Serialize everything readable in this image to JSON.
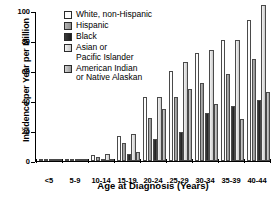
{
  "chart_data": {
    "type": "bar",
    "title": "",
    "subtitle": "",
    "xlabel": "Age at Diagnosis (Years)",
    "ylabel": "Incidence per Year per Million",
    "categories": [
      "<5",
      "5-9",
      "10-14",
      "15-19",
      "20-24",
      "25-29",
      "30-34",
      "35-39",
      "40-44"
    ],
    "ylim": [
      0,
      100
    ],
    "yticks": [
      0,
      20,
      40,
      60,
      80,
      100
    ],
    "ytick_labels": [
      "0",
      "20",
      "40",
      "60",
      "80",
      "100"
    ],
    "grid": false,
    "legend_position": "top-left-inside",
    "series": [
      {
        "name": "White, non-Hispanic",
        "color": "#fdfdfd",
        "values": [
          0.3,
          1.6,
          4.0,
          17.0,
          42.5,
          60.0,
          72.0,
          81.0,
          94.0
        ]
      },
      {
        "name": "Hispanic",
        "color": "#9d9d9d",
        "values": [
          0.3,
          1.3,
          3.0,
          12.0,
          29.0,
          42.5,
          52.0,
          58.0,
          68.0
        ]
      },
      {
        "name": "Black",
        "color": "#2a2a2a",
        "values": [
          0.2,
          0.5,
          1.2,
          5.0,
          15.0,
          19.5,
          32.0,
          36.5,
          41.0
        ]
      },
      {
        "name": "Asian or Pacific Islander",
        "color": "#e4e4e4",
        "values": [
          0.2,
          0.4,
          4.5,
          18.0,
          43.0,
          66.0,
          74.0,
          81.0,
          104.0
        ]
      },
      {
        "name": "American Indian or Native Alaskan",
        "color": "#b6b6b6",
        "values": [
          0.2,
          0.4,
          0.5,
          6.0,
          35.0,
          48.0,
          38.0,
          28.0,
          46.0
        ]
      }
    ]
  },
  "legend": {
    "items": [
      {
        "label": "White, non-Hispanic"
      },
      {
        "label": "Hispanic"
      },
      {
        "label": "Black"
      },
      {
        "label": "Asian or\nPacific Islander"
      },
      {
        "label": "American Indian\nor Native Alaskan"
      }
    ]
  },
  "axes": {
    "y_title": "Incidence per Year per Million",
    "x_title": "Age at Diagnosis (Years)"
  }
}
